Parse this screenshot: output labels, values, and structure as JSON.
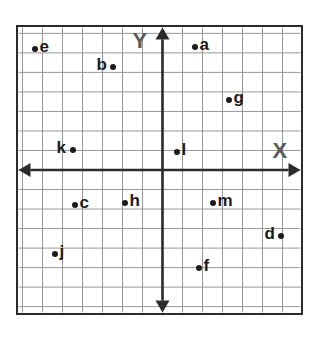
{
  "figure": {
    "background_color": "#ffffff",
    "border_color": "#2b2b2b",
    "grid_color": "#8c8c8c",
    "axis_color": "#2b2b2b",
    "point_color": "#1c1c1c",
    "axis_label_color": "#5a5a5a"
  },
  "axes": {
    "x_label": "X",
    "y_label": "Y",
    "x_arrow_left_icon": "arrow-left-icon",
    "x_arrow_right_icon": "arrow-right-icon",
    "y_arrow_up_icon": "arrow-up-icon",
    "y_arrow_down_icon": "arrow-down-icon"
  },
  "chart_data": {
    "type": "scatter",
    "xlabel": "X",
    "ylabel": "Y",
    "xlim": [
      -7.2,
      6.9
    ],
    "ylim": [
      -7.3,
      7.3
    ],
    "grid": true,
    "grid_step": 1,
    "legend": "none",
    "points": [
      {
        "label": "a",
        "x": 1.6,
        "y": 6.3,
        "label_side": "right"
      },
      {
        "label": "b",
        "x": -2.5,
        "y": 5.3,
        "label_side": "left"
      },
      {
        "label": "c",
        "x": -4.4,
        "y": -1.8,
        "label_side": "right"
      },
      {
        "label": "d",
        "x": 5.9,
        "y": -3.4,
        "label_side": "left"
      },
      {
        "label": "e",
        "x": -6.4,
        "y": 6.2,
        "label_side": "right"
      },
      {
        "label": "f",
        "x": 1.8,
        "y": -5.0,
        "label_side": "right"
      },
      {
        "label": "g",
        "x": 3.3,
        "y": 3.6,
        "label_side": "right"
      },
      {
        "label": "h",
        "x": -1.9,
        "y": -1.7,
        "label_side": "right"
      },
      {
        "label": "j",
        "x": -5.4,
        "y": -4.3,
        "label_side": "right"
      },
      {
        "label": "k",
        "x": -4.5,
        "y": 1.0,
        "label_side": "left"
      },
      {
        "label": "l",
        "x": 0.7,
        "y": 0.9,
        "label_side": "right"
      },
      {
        "label": "m",
        "x": 2.5,
        "y": -1.7,
        "label_side": "right"
      }
    ]
  }
}
